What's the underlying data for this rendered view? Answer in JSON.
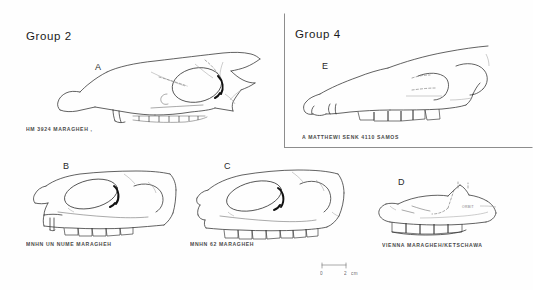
{
  "figure": {
    "groups": [
      {
        "id": "group2",
        "label": "Group 2"
      },
      {
        "id": "group4",
        "label": "Group 4"
      }
    ],
    "specimens": [
      {
        "letter": "A",
        "caption": "HM 3924  MARAGHEH  ,",
        "group": "Group 2",
        "view": "lateral skull"
      },
      {
        "letter": "B",
        "caption": "MNHN   UN NUME  MARAGHEH",
        "group": "Group 2",
        "view": "lateral skull"
      },
      {
        "letter": "C",
        "caption": "MNHN   62  MARAGHEH",
        "group": "Group 2",
        "view": "lateral skull"
      },
      {
        "letter": "D",
        "caption": "VIENNA   MARAGHEH/KETSCHAWA",
        "group": "Group 2",
        "view": "lateral skull",
        "annotation": "ORBIT"
      },
      {
        "letter": "E",
        "caption": "A  MATTHEWI   SENK  4110  SAMOS",
        "group": "Group 4",
        "view": "lateral skull"
      }
    ],
    "scale_bar": {
      "start_label": "0",
      "end_label": "2",
      "unit_label": "cm"
    }
  }
}
